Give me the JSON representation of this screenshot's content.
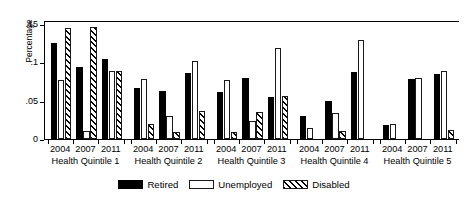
{
  "chart_data": {
    "type": "bar",
    "title": "",
    "xlabel": "",
    "ylabel": "Percentage",
    "ylim": [
      0,
      0.155
    ],
    "yticks": [
      0,
      0.05,
      0.1,
      0.15
    ],
    "ytick_labels": [
      "0",
      ".05",
      ".1",
      ".15"
    ],
    "grid": false,
    "legend_position": "bottom-center",
    "groups": [
      "Health Quintile 1",
      "Health Quintile 2",
      "Health Quintile 3",
      "Health Quintile 4",
      "Health Quintile 5"
    ],
    "subgroups": [
      "2004",
      "2007",
      "2011"
    ],
    "series": [
      {
        "name": "Retired",
        "style": "solid-black",
        "color": "#000000",
        "values": [
          [
            0.125,
            0.094,
            0.104
          ],
          [
            0.066,
            0.063,
            0.086
          ],
          [
            0.061,
            0.08,
            0.055
          ],
          [
            0.03,
            0.05,
            0.087
          ],
          [
            0.018,
            0.078,
            0.085
          ]
        ]
      },
      {
        "name": "Unemployed",
        "style": "open-white",
        "color": "#ffffff",
        "values": [
          [
            0.077,
            0.011,
            0.089
          ],
          [
            0.078,
            0.03,
            0.101
          ],
          [
            0.077,
            0.023,
            0.118
          ],
          [
            0.014,
            0.034,
            0.129
          ],
          [
            0.02,
            0.08,
            0.088
          ]
        ]
      },
      {
        "name": "Disabled",
        "style": "hatched",
        "color": "#ffffff",
        "values": [
          [
            0.145,
            0.146,
            0.089
          ],
          [
            0.02,
            0.009,
            0.036
          ],
          [
            0.009,
            0.035,
            0.056
          ],
          [
            0.0,
            0.01,
            0.0
          ],
          [
            0.0,
            0.0,
            0.012
          ]
        ]
      }
    ]
  },
  "legend": {
    "items": [
      {
        "label": "Retired",
        "style": "retired"
      },
      {
        "label": "Unemployed",
        "style": "unemployed"
      },
      {
        "label": "Disabled",
        "style": "disabled"
      }
    ]
  }
}
